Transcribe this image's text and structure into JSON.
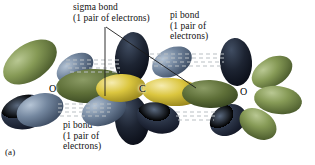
{
  "figure": {
    "panel_label": "(a)",
    "molecule": "CO2"
  },
  "annotations": {
    "sigma_bond": {
      "line1": "sigma bond",
      "line2": "(1 pair of electrons)",
      "text": "sigma bond\n(1 pair of electrons)"
    },
    "pi_bond_top": {
      "line1": "pi bond",
      "line2": "(1 pair of",
      "line3": "electrons)",
      "text": "pi bond\n(1 pair of\nelectrons)"
    },
    "pi_bond_bottom": {
      "line1": "pi bond",
      "line2": "(1 pair of",
      "line3": "electrons)",
      "text": "pi bond\n(1 pair of\nelectrons)"
    }
  },
  "atoms": [
    {
      "id": "oxygen-left",
      "label": "O",
      "x": 52,
      "y": 89
    },
    {
      "id": "carbon-center",
      "label": "C",
      "x": 142,
      "y": 89
    },
    {
      "id": "oxygen-right",
      "label": "O",
      "x": 243,
      "y": 92
    }
  ],
  "colors": {
    "lobe_green": "#7d914f",
    "lobe_green_dark": "#4f5f30",
    "lobe_green_light": "#a3b578",
    "lobe_blue": "#6d7f96",
    "lobe_blue_dark": "#39475c",
    "lobe_blue_light": "#93a4ba",
    "lobe_navy": "#2b3344",
    "lobe_navy_dark": "#14192a",
    "lobe_yellow": "#d8c23c",
    "lobe_yellow_dark": "#9c8a1c",
    "lobe_yellow_light": "#efe08a",
    "dash_line": "#b9c0c4",
    "leader_line": "#1a1a1a",
    "text": "#111111",
    "background": "#ffffff"
  }
}
